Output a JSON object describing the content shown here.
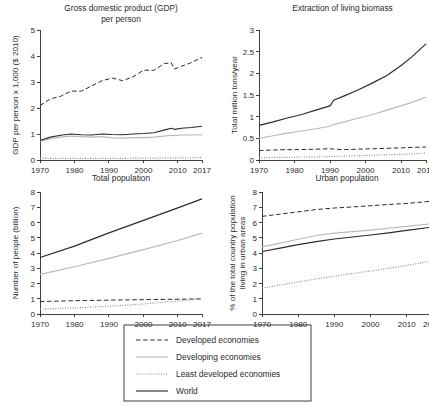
{
  "figure": {
    "x_tick_labels": [
      "1970",
      "1980",
      "1990",
      "2000",
      "2010",
      "2017"
    ],
    "x_ticks": [
      1970,
      1980,
      1990,
      2000,
      2010,
      2017
    ],
    "xlim": [
      1970,
      2017
    ]
  },
  "legend": {
    "position": "bottom-center",
    "items": [
      {
        "label": "Developed economies",
        "style": "dashed",
        "color": "#2b2b2b"
      },
      {
        "label": "Developing economies",
        "style": "solid",
        "color": "#b9b9b9"
      },
      {
        "label": "Least developed economies",
        "style": "dotted",
        "color": "#8d8d8d"
      },
      {
        "label": "World",
        "style": "solid",
        "color": "#2b2b2b"
      }
    ]
  },
  "chart_data": [
    {
      "id": "gdp",
      "type": "line",
      "title": "Gross domestic product (GDP) per person",
      "title_lines": [
        "Gross domestic product (GDP)",
        "per person"
      ],
      "xlabel": "",
      "ylabel": "GDP per person x 1,000 ($ 2010)",
      "ylim": [
        0,
        5
      ],
      "yticks": [
        0,
        1,
        2,
        3,
        4,
        5
      ],
      "ytick_labels": [
        "0",
        "1",
        "2",
        "3",
        "4",
        "5"
      ],
      "xlim": [
        1970,
        2017
      ],
      "grid": false,
      "x": [
        1970,
        1973,
        1976,
        1979,
        1982,
        1985,
        1988,
        1991,
        1994,
        1997,
        2000,
        2003,
        2006,
        2008,
        2009,
        2011,
        2014,
        2017
      ],
      "series": [
        {
          "name": "Developed economies",
          "style": "dashed",
          "color": "#2b2b2b",
          "values": [
            2.1,
            2.35,
            2.45,
            2.65,
            2.65,
            2.85,
            3.05,
            3.15,
            3.05,
            3.2,
            3.45,
            3.45,
            3.7,
            3.75,
            3.5,
            3.6,
            3.75,
            3.95
          ]
        },
        {
          "name": "Developing economies",
          "style": "solid",
          "color": "#b9b9b9",
          "values": [
            0.72,
            0.82,
            0.88,
            0.92,
            0.9,
            0.88,
            0.9,
            0.85,
            0.84,
            0.86,
            0.86,
            0.88,
            0.92,
            0.95,
            0.94,
            0.96,
            0.96,
            0.97
          ]
        },
        {
          "name": "Least developed economies",
          "style": "dotted",
          "color": "#8d8d8d",
          "values": [
            0.06,
            0.06,
            0.06,
            0.06,
            0.06,
            0.06,
            0.06,
            0.06,
            0.06,
            0.07,
            0.07,
            0.07,
            0.08,
            0.08,
            0.08,
            0.08,
            0.09,
            0.09
          ]
        },
        {
          "name": "World",
          "style": "solid",
          "color": "#2b2b2b",
          "values": [
            0.75,
            0.88,
            0.95,
            1.0,
            0.97,
            0.96,
            1.0,
            0.98,
            0.97,
            1.0,
            1.02,
            1.05,
            1.15,
            1.22,
            1.18,
            1.22,
            1.25,
            1.3
          ]
        }
      ]
    },
    {
      "id": "biomass",
      "type": "line",
      "title": "Extraction of living biomass",
      "title_lines": [
        "Extraction of living biomass"
      ],
      "xlabel": "",
      "ylabel": "Total million tons/year",
      "ylim": [
        0,
        3
      ],
      "yticks": [
        0,
        0.5,
        1,
        1.5,
        2,
        2.5,
        3
      ],
      "ytick_labels": [
        "0",
        "0.5",
        "1",
        "1.5",
        "2",
        "2.5",
        "3"
      ],
      "xlim": [
        1970,
        2017
      ],
      "grid": false,
      "x": [
        1970,
        1974,
        1978,
        1982,
        1986,
        1990,
        1991,
        1994,
        1998,
        2002,
        2006,
        2010,
        2013,
        2017
      ],
      "series": [
        {
          "name": "Developed economies",
          "style": "dashed",
          "color": "#2b2b2b",
          "values": [
            0.22,
            0.23,
            0.24,
            0.24,
            0.25,
            0.26,
            0.25,
            0.24,
            0.25,
            0.26,
            0.27,
            0.28,
            0.29,
            0.3
          ]
        },
        {
          "name": "Developing economies",
          "style": "solid",
          "color": "#b9b9b9",
          "values": [
            0.5,
            0.56,
            0.62,
            0.67,
            0.72,
            0.78,
            0.82,
            0.88,
            0.97,
            1.05,
            1.15,
            1.25,
            1.33,
            1.45
          ]
        },
        {
          "name": "Least developed economies",
          "style": "dotted",
          "color": "#8d8d8d",
          "values": [
            0.05,
            0.06,
            0.06,
            0.07,
            0.07,
            0.08,
            0.08,
            0.09,
            0.1,
            0.11,
            0.12,
            0.13,
            0.14,
            0.16
          ]
        },
        {
          "name": "World",
          "style": "solid",
          "color": "#2b2b2b",
          "values": [
            0.8,
            0.88,
            0.97,
            1.05,
            1.15,
            1.25,
            1.38,
            1.48,
            1.62,
            1.78,
            1.95,
            2.18,
            2.38,
            2.68
          ]
        }
      ]
    },
    {
      "id": "totalpop",
      "type": "line",
      "title": "Total population",
      "title_lines": [
        "Total population"
      ],
      "xlabel": "",
      "ylabel": "Number of people (billion)",
      "ylim": [
        0,
        8
      ],
      "yticks": [
        0,
        1,
        2,
        3,
        4,
        5,
        6,
        7,
        8
      ],
      "ytick_labels": [
        "0",
        "1",
        "2",
        "3",
        "4",
        "5",
        "6",
        "7",
        "8"
      ],
      "xlim": [
        1970,
        2017
      ],
      "grid": false,
      "x": [
        1970,
        1980,
        1990,
        2000,
        2010,
        2017
      ],
      "series": [
        {
          "name": "Developed economies",
          "style": "dashed",
          "color": "#2b2b2b",
          "values": [
            0.82,
            0.87,
            0.91,
            0.94,
            0.97,
            0.99
          ]
        },
        {
          "name": "Developing economies",
          "style": "solid",
          "color": "#b9b9b9",
          "values": [
            2.6,
            3.1,
            3.65,
            4.22,
            4.82,
            5.3
          ]
        },
        {
          "name": "Least developed economies",
          "style": "dotted",
          "color": "#8d8d8d",
          "values": [
            0.32,
            0.4,
            0.51,
            0.66,
            0.85,
            1.0
          ]
        },
        {
          "name": "World",
          "style": "solid",
          "color": "#2b2b2b",
          "values": [
            3.7,
            4.45,
            5.32,
            6.14,
            6.96,
            7.55
          ]
        }
      ]
    },
    {
      "id": "urbanpop",
      "type": "line",
      "title": "Urban population",
      "title_lines": [
        "Urban population"
      ],
      "xlabel": "",
      "ylabel": "% of the total country population living in urban areas",
      "ylabel_lines": [
        "% of the total country population",
        "living in urban areas"
      ],
      "ylim": [
        0,
        8
      ],
      "yticks": [
        0,
        1,
        2,
        3,
        4,
        5,
        6,
        7,
        8
      ],
      "ytick_labels": [
        "0",
        "1",
        "2",
        "3",
        "4",
        "5",
        "6",
        "7",
        "8"
      ],
      "xlim": [
        1970,
        2017
      ],
      "grid": false,
      "x": [
        1970,
        1975,
        1980,
        1985,
        1990,
        1995,
        2000,
        2005,
        2010,
        2017
      ],
      "series": [
        {
          "name": "Developed economies",
          "style": "dashed",
          "color": "#2b2b2b",
          "values": [
            6.4,
            6.55,
            6.7,
            6.85,
            6.95,
            7.02,
            7.1,
            7.18,
            7.25,
            7.4
          ]
        },
        {
          "name": "Developing economies",
          "style": "solid",
          "color": "#b9b9b9",
          "values": [
            4.4,
            4.65,
            4.9,
            5.15,
            5.3,
            5.4,
            5.5,
            5.62,
            5.75,
            5.92
          ]
        },
        {
          "name": "Least developed economies",
          "style": "dotted",
          "color": "#8d8d8d",
          "values": [
            1.7,
            1.9,
            2.1,
            2.3,
            2.48,
            2.65,
            2.82,
            3.0,
            3.18,
            3.48
          ]
        },
        {
          "name": "World",
          "style": "solid",
          "color": "#2b2b2b",
          "values": [
            4.1,
            4.32,
            4.55,
            4.75,
            4.92,
            5.05,
            5.18,
            5.32,
            5.48,
            5.7
          ]
        }
      ]
    }
  ]
}
